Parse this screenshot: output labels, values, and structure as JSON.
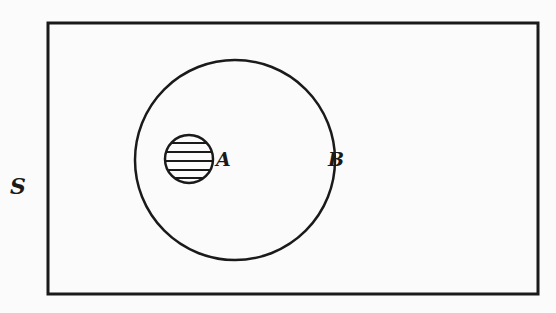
{
  "diagram": {
    "type": "venn",
    "universal_set": {
      "label": "S",
      "shape": "rectangle"
    },
    "sets": [
      {
        "label": "B",
        "shape": "circle",
        "contains": [
          "A"
        ]
      },
      {
        "label": "A",
        "shape": "circle",
        "shaded": true,
        "fill_pattern": "horizontal-hatch",
        "subset_of": "B"
      }
    ],
    "colors": {
      "stroke": "#1a1a1a",
      "background": "#fbfbfb"
    }
  }
}
